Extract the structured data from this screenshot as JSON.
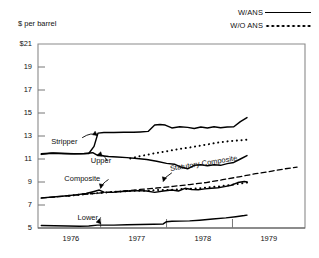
{
  "legend": {
    "items": [
      {
        "label": "W/ANS",
        "style": "solid"
      },
      {
        "label": "W/O ANS",
        "style": "dotted"
      }
    ]
  },
  "axis_title": "$ per barrel",
  "chart_data": {
    "type": "line",
    "title": "",
    "xlabel": "",
    "ylabel": "$ per barrel",
    "xlim": [
      1975.55,
      1979.6
    ],
    "ylim": [
      5,
      21
    ],
    "yticks": [
      "$21",
      "19",
      "17",
      "15",
      "13",
      "11",
      "9",
      "7",
      "5"
    ],
    "ytick_values": [
      21,
      19,
      17,
      15,
      13,
      11,
      9,
      7,
      5
    ],
    "xticks": [
      "1976",
      "1977",
      "1978",
      "1979"
    ],
    "xtick_values": [
      1976.05,
      1977.05,
      1978.05,
      1979.05
    ],
    "xgrid_marks": [
      1976.5,
      1977.5,
      1978.5
    ],
    "grid": false,
    "legend_position": "top-right",
    "annotations": [
      {
        "text": "Stripper",
        "x": 1975.75,
        "y": 12.5
      },
      {
        "text": "Upper",
        "x": 1976.35,
        "y": 10.85
      },
      {
        "text": "Composite",
        "x": 1975.95,
        "y": 9.3
      },
      {
        "text": "Lower",
        "x": 1976.15,
        "y": 5.9
      },
      {
        "text": "Statutory Composite",
        "x": 1977.55,
        "y": 10.1
      }
    ],
    "series": [
      {
        "name": "Stripper",
        "style": "solid",
        "x": [
          1975.6,
          1975.75,
          1975.9,
          1976.05,
          1976.2,
          1976.32,
          1976.4,
          1976.46,
          1976.55,
          1976.7,
          1976.85,
          1977.0,
          1977.1,
          1977.22,
          1977.32,
          1977.4,
          1977.48,
          1977.58,
          1977.7,
          1977.82,
          1977.92,
          1978.02,
          1978.12,
          1978.22,
          1978.32,
          1978.42,
          1978.52,
          1978.62,
          1978.72
        ],
        "y": [
          11.4,
          11.5,
          11.48,
          11.45,
          11.45,
          11.48,
          12.1,
          13.25,
          13.3,
          13.3,
          13.32,
          13.32,
          13.35,
          13.4,
          13.95,
          14.0,
          13.95,
          13.7,
          13.8,
          13.75,
          13.65,
          13.78,
          13.7,
          13.8,
          13.72,
          13.78,
          13.8,
          14.25,
          14.6
        ]
      },
      {
        "name": "Upper",
        "style": "solid",
        "x": [
          1975.6,
          1975.78,
          1975.95,
          1976.1,
          1976.25,
          1976.38,
          1976.46,
          1976.52,
          1976.62,
          1976.75,
          1976.9,
          1977.05,
          1977.2,
          1977.35,
          1977.5,
          1977.62,
          1977.72,
          1977.82,
          1977.92,
          1978.02,
          1978.12,
          1978.22,
          1978.32,
          1978.42,
          1978.52,
          1978.62,
          1978.72
        ],
        "y": [
          11.45,
          11.52,
          11.48,
          11.45,
          11.48,
          11.55,
          11.3,
          11.28,
          11.22,
          11.18,
          11.12,
          11.05,
          10.95,
          10.8,
          10.62,
          10.55,
          10.3,
          10.15,
          10.45,
          10.5,
          10.42,
          10.5,
          10.45,
          10.6,
          10.7,
          11.0,
          11.3
        ]
      },
      {
        "name": "W/O ANS (upper dotted)",
        "style": "dotted",
        "x": [
          1976.95,
          1977.1,
          1977.25,
          1977.4,
          1977.55,
          1977.7,
          1977.85,
          1978.0,
          1978.15,
          1978.3,
          1978.45,
          1978.6,
          1978.72
        ],
        "y": [
          11.05,
          11.25,
          11.42,
          11.58,
          11.72,
          11.88,
          12.0,
          12.15,
          12.3,
          12.45,
          12.55,
          12.62,
          12.68
        ]
      },
      {
        "name": "Composite",
        "style": "solid",
        "x": [
          1975.6,
          1975.78,
          1975.95,
          1976.12,
          1976.28,
          1976.4,
          1976.48,
          1976.55,
          1976.68,
          1976.82,
          1976.95,
          1977.08,
          1977.2,
          1977.32,
          1977.45,
          1977.58,
          1977.68,
          1977.78,
          1977.88,
          1977.98,
          1978.08,
          1978.18,
          1978.28,
          1978.38,
          1978.48,
          1978.58,
          1978.68,
          1978.72
        ],
        "y": [
          7.62,
          7.7,
          7.78,
          7.88,
          8.0,
          8.18,
          8.3,
          8.12,
          8.1,
          8.18,
          8.22,
          8.25,
          8.22,
          8.1,
          8.22,
          8.3,
          8.22,
          8.45,
          8.35,
          8.32,
          8.4,
          8.45,
          8.5,
          8.6,
          8.72,
          8.95,
          9.05,
          9.0
        ]
      },
      {
        "name": "W/O ANS (composite dotted)",
        "style": "dotted",
        "x": [
          1976.02,
          1976.18,
          1976.35,
          1976.5,
          1976.65,
          1976.8,
          1976.95,
          1977.1,
          1977.25,
          1977.4,
          1977.55,
          1977.7,
          1977.85,
          1978.0,
          1978.15,
          1978.3,
          1978.45,
          1978.6,
          1978.72
        ],
        "y": [
          7.8,
          7.9,
          8.0,
          8.05,
          8.12,
          8.18,
          8.22,
          8.25,
          8.25,
          8.32,
          8.3,
          8.38,
          8.4,
          8.45,
          8.55,
          8.62,
          8.72,
          8.85,
          8.95
        ]
      },
      {
        "name": "Statutory Composite",
        "style": "dashed",
        "x": [
          1975.6,
          1975.85,
          1976.1,
          1976.35,
          1976.6,
          1976.85,
          1977.1,
          1977.35,
          1977.6,
          1977.85,
          1978.1,
          1978.35,
          1978.6,
          1978.85,
          1979.1,
          1979.3,
          1979.48
        ],
        "y": [
          7.6,
          7.72,
          7.85,
          7.98,
          8.1,
          8.22,
          8.35,
          8.48,
          8.62,
          8.78,
          8.95,
          9.2,
          9.45,
          9.72,
          9.95,
          10.15,
          10.3
        ]
      },
      {
        "name": "Lower",
        "style": "solid",
        "x": [
          1975.6,
          1975.8,
          1976.0,
          1976.18,
          1976.32,
          1976.45,
          1976.55,
          1976.7,
          1976.9,
          1977.1,
          1977.3,
          1977.45,
          1977.5,
          1977.58,
          1977.7,
          1977.85,
          1978.0,
          1978.2,
          1978.4,
          1978.55,
          1978.68,
          1978.72
        ],
        "y": [
          5.22,
          5.2,
          5.18,
          5.15,
          5.18,
          5.25,
          5.25,
          5.25,
          5.28,
          5.3,
          5.32,
          5.35,
          5.55,
          5.58,
          5.6,
          5.62,
          5.68,
          5.78,
          5.88,
          5.98,
          6.08,
          6.12
        ]
      }
    ]
  }
}
